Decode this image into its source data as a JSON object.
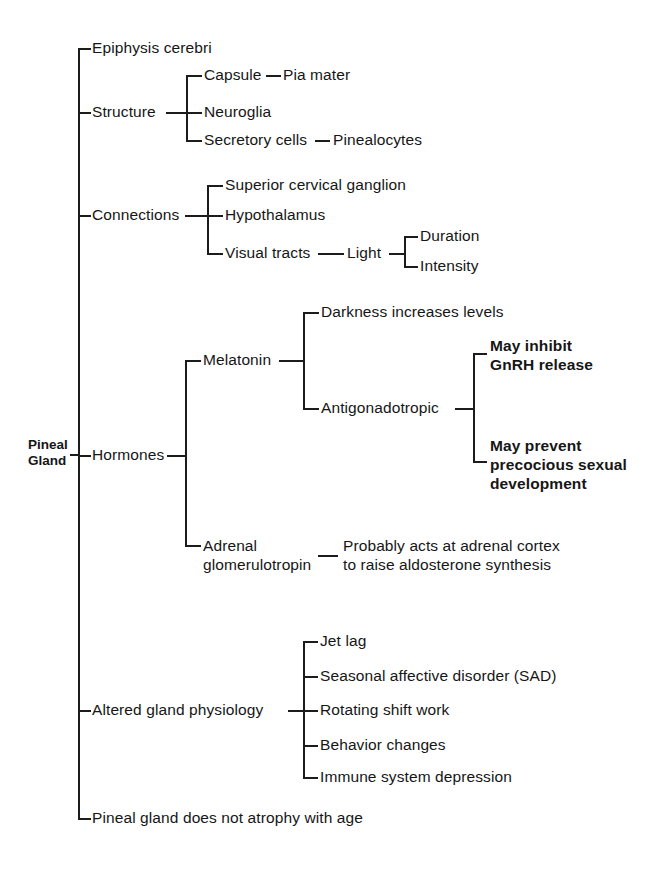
{
  "diagram": {
    "root": {
      "label": "Pineal\nGland"
    },
    "branches": [
      {
        "id": "epiphysis",
        "label": "Epiphysis cerebri"
      },
      {
        "id": "structure",
        "label": "Structure",
        "children": [
          {
            "label": "Capsule",
            "leaf": "Pia mater"
          },
          {
            "label": "Neuroglia"
          },
          {
            "label": "Secretory cells",
            "leaf": "Pinealocytes"
          }
        ]
      },
      {
        "id": "connections",
        "label": "Connections",
        "children": [
          {
            "label": "Superior cervical ganglion"
          },
          {
            "label": "Hypothalamus"
          },
          {
            "label": "Visual tracts",
            "leaf": "Light",
            "grandchildren": [
              {
                "label": "Duration"
              },
              {
                "label": "Intensity"
              }
            ]
          }
        ]
      },
      {
        "id": "hormones",
        "label": "Hormones",
        "children": [
          {
            "label": "Melatonin",
            "grandchildren": [
              {
                "label": "Darkness increases levels"
              },
              {
                "label": "Antigonadotropic",
                "greatgrandchildren": [
                  {
                    "label": "May inhibit\nGnRH  release",
                    "bold": true
                  },
                  {
                    "label": "May prevent\nprecocious sexual\ndevelopment",
                    "bold": true
                  }
                ]
              }
            ]
          },
          {
            "label": "Adrenal\nglomerulotropin",
            "leaf": "Probably acts at adrenal cortex\nto raise aldosterone synthesis"
          }
        ]
      },
      {
        "id": "altered",
        "label": "Altered gland physiology",
        "children": [
          {
            "label": "Jet lag"
          },
          {
            "label": "Seasonal affective disorder (SAD)"
          },
          {
            "label": "Rotating shift work"
          },
          {
            "label": "Behavior changes"
          },
          {
            "label": "Immune system depression"
          }
        ]
      },
      {
        "id": "atrophy",
        "label": "Pineal gland does not atrophy with age"
      }
    ]
  }
}
